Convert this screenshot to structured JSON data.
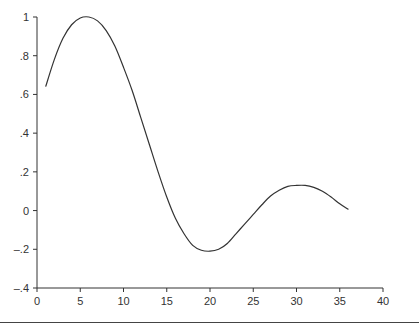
{
  "chart_data": {
    "type": "line",
    "title": "",
    "xlabel": "",
    "ylabel": "",
    "xlim": [
      0,
      40
    ],
    "ylim": [
      -0.4,
      1
    ],
    "x_ticks": [
      0,
      5,
      10,
      15,
      20,
      25,
      30,
      35,
      40
    ],
    "x_tick_labels": [
      "0",
      "5",
      "10",
      "15",
      "20",
      "25",
      "30",
      "35",
      "40"
    ],
    "y_ticks": [
      -0.4,
      -0.2,
      0,
      0.2,
      0.4,
      0.6,
      0.8,
      1
    ],
    "y_tick_labels": [
      "–.4",
      "–.2",
      "0",
      ".2",
      ".4",
      ".6",
      ".8",
      "1"
    ],
    "grid": false,
    "legend": null,
    "series": [
      {
        "name": "curve",
        "color": "#333333",
        "x": [
          1,
          2,
          3,
          4,
          5,
          6,
          7,
          8,
          9,
          10,
          11,
          12,
          13,
          14,
          15,
          16,
          17,
          18,
          19,
          20,
          21,
          22,
          23,
          24,
          25,
          26,
          27,
          28,
          29,
          30,
          31,
          32,
          33,
          34,
          35,
          36
        ],
        "values": [
          0.64,
          0.78,
          0.89,
          0.96,
          0.995,
          1.0,
          0.98,
          0.93,
          0.85,
          0.74,
          0.62,
          0.48,
          0.34,
          0.2,
          0.07,
          -0.04,
          -0.12,
          -0.18,
          -0.205,
          -0.21,
          -0.2,
          -0.17,
          -0.12,
          -0.07,
          -0.02,
          0.03,
          0.075,
          0.105,
          0.125,
          0.13,
          0.13,
          0.12,
          0.1,
          0.07,
          0.035,
          0.005
        ]
      }
    ]
  },
  "caption": {
    "text": ""
  }
}
